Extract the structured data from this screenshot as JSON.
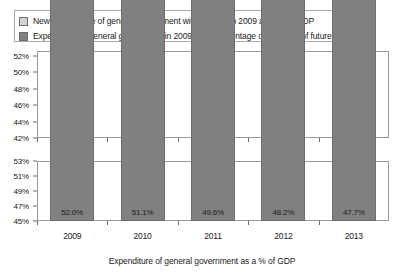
{
  "legend": {
    "items": [
      {
        "label": "New expenditure of general government with respect to 2009 as a % of GDP",
        "color": "#d2d2d2",
        "swatch_name": "legend-swatch-new-expenditure"
      },
      {
        "label": "Expenditure of general government in 2009, as a percentage of the GDP of future years",
        "color": "#808080",
        "swatch_name": "legend-swatch-2009-expenditure"
      }
    ]
  },
  "axis_title": "Expenditure of general government as a % of GDP",
  "colors": {
    "dark_gray": "#808080",
    "light_gray": "#d2d2d2",
    "border": "#6e6e6e",
    "frame": "#9a9a9a"
  },
  "chart_data": [
    {
      "type": "bar",
      "id": "stacked-chart",
      "title": "",
      "xlabel": "",
      "ylabel": "",
      "stacked": true,
      "grid": false,
      "legend_position": "top",
      "categories": [
        "2009",
        "2010",
        "2011",
        "2012",
        "2013"
      ],
      "ylim": [
        42,
        52.6
      ],
      "yticks": [
        42,
        44,
        46,
        48,
        50,
        52
      ],
      "ytick_labels": [
        "42%",
        "44%",
        "46%",
        "48%",
        "50%",
        "52%"
      ],
      "series": [
        {
          "name": "Expenditure of general government in 2009, as a percentage of the GDP of future years",
          "color": "#808080",
          "values": [
            52.0,
            51.1,
            49.4,
            47.6,
            45.8
          ],
          "labels": [
            "52.0%",
            "51.1%",
            "49.4%",
            "47.6%",
            "45.8%"
          ]
        },
        {
          "name": "New expenditure of general government with respect to 2009 as a % of GDP",
          "color": "#d2d2d2",
          "values": [
            0.0,
            0.0,
            0.2,
            0.6,
            1.9
          ],
          "labels": [
            "",
            "",
            "0.2%",
            "0.6%",
            "1.9%"
          ]
        }
      ],
      "totals": [
        52.0,
        51.1,
        49.6,
        48.2,
        47.7
      ]
    },
    {
      "type": "bar",
      "id": "totals-chart",
      "title": "",
      "xlabel": "Expenditure of general government as a % of GDP",
      "ylabel": "",
      "stacked": false,
      "grid": false,
      "categories": [
        "2009",
        "2010",
        "2011",
        "2012",
        "2013"
      ],
      "ylim": [
        45,
        53
      ],
      "yticks": [
        45,
        47,
        49,
        51,
        53
      ],
      "ytick_labels": [
        "45%",
        "47%",
        "49%",
        "51%",
        "53%"
      ],
      "series": [
        {
          "name": "Expenditure of general government as a % of GDP",
          "color": "#808080",
          "values": [
            52.0,
            51.1,
            49.6,
            48.2,
            47.7
          ],
          "labels": [
            "52.0%",
            "51.1%",
            "49.6%",
            "48.2%",
            "47.7%"
          ]
        }
      ]
    }
  ]
}
